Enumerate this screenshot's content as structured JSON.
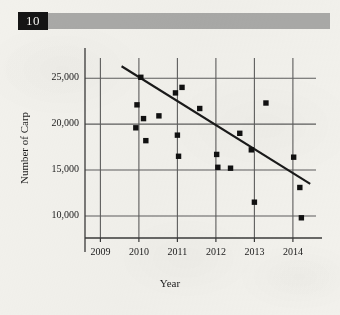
{
  "header": {
    "chapter_number": "10",
    "bar_color": "#a9a9a7",
    "number_box_color": "#151515"
  },
  "figure": {
    "marker_color": "#111111",
    "trendline_color": "#1a1a1a",
    "grid_color": "#5d5d5d",
    "axis_color": "#3a3a3a",
    "background_color": "#f2f1ec"
  },
  "chart_data": {
    "type": "scatter",
    "title": "",
    "xlabel": "Year",
    "ylabel": "Number of Carp",
    "xlim": [
      2008.6,
      2014.6
    ],
    "ylim": [
      7600,
      27200
    ],
    "grid": true,
    "legend": false,
    "xticks": [
      2009,
      2010,
      2011,
      2012,
      2013,
      2014
    ],
    "xtick_labels": [
      "2009",
      "2010",
      "2011",
      "2012",
      "2013",
      "2014"
    ],
    "yticks": [
      10000,
      15000,
      20000,
      25000
    ],
    "ytick_labels": [
      "10,000",
      "15,000",
      "20,000",
      "25,000"
    ],
    "points": [
      {
        "x": 2009.95,
        "y": 22100
      },
      {
        "x": 2009.92,
        "y": 19600
      },
      {
        "x": 2010.05,
        "y": 25100
      },
      {
        "x": 2010.12,
        "y": 20600
      },
      {
        "x": 2010.18,
        "y": 18200
      },
      {
        "x": 2010.52,
        "y": 20900
      },
      {
        "x": 2010.95,
        "y": 23400
      },
      {
        "x": 2011.0,
        "y": 18800
      },
      {
        "x": 2011.03,
        "y": 16500
      },
      {
        "x": 2011.12,
        "y": 24000
      },
      {
        "x": 2011.58,
        "y": 21700
      },
      {
        "x": 2012.02,
        "y": 16700
      },
      {
        "x": 2012.05,
        "y": 15300
      },
      {
        "x": 2012.38,
        "y": 15200
      },
      {
        "x": 2012.62,
        "y": 19000
      },
      {
        "x": 2012.92,
        "y": 17200
      },
      {
        "x": 2013.0,
        "y": 11500
      },
      {
        "x": 2013.3,
        "y": 22300
      },
      {
        "x": 2014.02,
        "y": 16400
      },
      {
        "x": 2014.18,
        "y": 13100
      },
      {
        "x": 2014.22,
        "y": 9800
      }
    ],
    "trendline": {
      "label": "line of best fit",
      "x_start": 2009.55,
      "y_start": 26300,
      "x_end": 2014.45,
      "y_end": 13500
    }
  }
}
